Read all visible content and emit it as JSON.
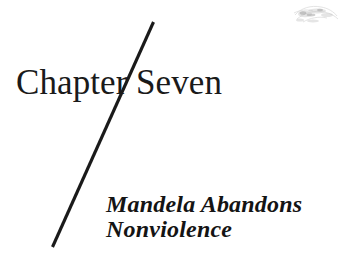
{
  "page": {
    "background_color": "#ffffff",
    "text_color": "#1a1a1a",
    "width": 350,
    "height": 267
  },
  "heading": {
    "chapter_label": "Chapter",
    "number_label": "Seven",
    "divider": "diagonal-slash-rule"
  },
  "subtitle": {
    "line1": "Mandela Abandons",
    "line2": "Nonviolence"
  },
  "artifacts": {
    "smudge": "scan-smudge-icon"
  }
}
